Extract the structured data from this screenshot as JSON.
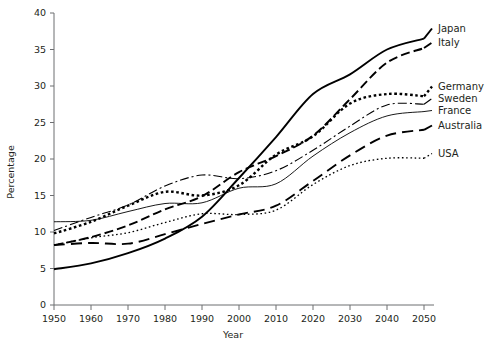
{
  "chart_data": {
    "type": "line",
    "title": "",
    "xlabel": "Year",
    "ylabel": "Percentage",
    "xlim": [
      1950,
      2050
    ],
    "ylim": [
      0,
      40
    ],
    "ytick_step": 5,
    "xtick_step": 10,
    "grid": false,
    "legend_position": "right-inline-labels",
    "x": [
      1950,
      1960,
      1970,
      1980,
      1990,
      2000,
      2010,
      2020,
      2030,
      2040,
      2050
    ],
    "xticklabels": [
      "1950",
      "1960",
      "1970",
      "1980",
      "1990",
      "2000",
      "2010",
      "2020",
      "2030",
      "2040",
      "2050"
    ],
    "yticklabels": [
      "0",
      "5",
      "10",
      "15",
      "20",
      "25",
      "30",
      "35",
      "40"
    ],
    "series": [
      {
        "name": "Japan",
        "style": "solid-thick",
        "values": [
          4.9,
          5.7,
          7.1,
          9.1,
          12.1,
          17.4,
          23.0,
          28.9,
          31.6,
          35.0,
          36.5
        ]
      },
      {
        "name": "Italy",
        "style": "dashed-long",
        "values": [
          8.2,
          9.3,
          10.9,
          13.1,
          14.9,
          18.2,
          20.4,
          23.2,
          28.2,
          33.2,
          35.2
        ]
      },
      {
        "name": "Germany",
        "style": "dotted-bold",
        "values": [
          9.8,
          11.4,
          13.6,
          15.5,
          15.0,
          16.4,
          20.6,
          23.1,
          27.6,
          28.9,
          28.6
        ]
      },
      {
        "name": "Sweden",
        "style": "dash-dot",
        "values": [
          10.2,
          12.0,
          13.7,
          16.3,
          17.8,
          17.3,
          18.4,
          21.2,
          24.5,
          27.4,
          27.5
        ]
      },
      {
        "name": "France",
        "style": "solid-thin",
        "values": [
          11.4,
          11.6,
          12.8,
          13.9,
          14.0,
          16.0,
          16.6,
          20.4,
          23.6,
          25.9,
          26.5
        ]
      },
      {
        "name": "Australia",
        "style": "dashed-medium",
        "values": [
          8.2,
          8.5,
          8.4,
          9.7,
          11.1,
          12.4,
          13.6,
          17.0,
          20.5,
          23.2,
          24.0
        ]
      },
      {
        "name": "USA",
        "style": "dotted-fine",
        "values": [
          8.2,
          9.2,
          9.9,
          11.3,
          12.5,
          12.4,
          13.0,
          16.5,
          19.1,
          20.1,
          20.1
        ]
      }
    ],
    "series_labels": [
      {
        "name": "Japan",
        "value_at_2050": 36.5
      },
      {
        "name": "Italy",
        "value_at_2050": 35.2
      },
      {
        "name": "Germany",
        "value_at_2050": 28.6
      },
      {
        "name": "Sweden",
        "value_at_2050": 27.5
      },
      {
        "name": "France",
        "value_at_2050": 26.5
      },
      {
        "name": "Australia",
        "value_at_2050": 24.0
      },
      {
        "name": "USA",
        "value_at_2050": 20.1
      }
    ]
  }
}
